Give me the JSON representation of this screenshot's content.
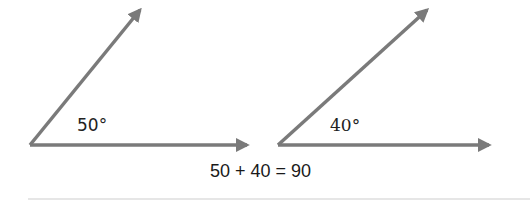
{
  "diagram": {
    "angles": [
      {
        "label": "50°",
        "degrees": 50
      },
      {
        "label": "40°",
        "degrees": 40
      }
    ],
    "equation": "50 + 40 = 90",
    "colors": {
      "ray": "#7a7a7a",
      "text": "#222222",
      "rule": "#e6e6e6"
    }
  }
}
